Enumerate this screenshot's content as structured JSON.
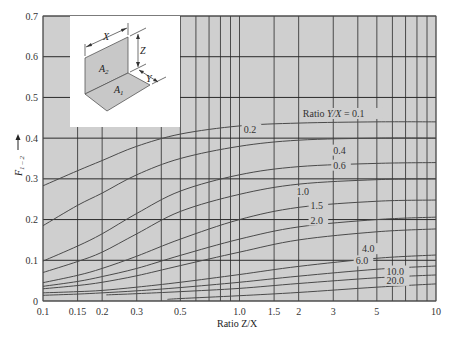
{
  "chart_data": {
    "type": "line",
    "title": "",
    "xlabel": "Ratio Z/X",
    "ylabel": "F1-2",
    "xscale": "log",
    "xlim": [
      0.1,
      10
    ],
    "ylim": [
      0,
      0.7
    ],
    "grid": true,
    "x_ticks": [
      0.1,
      0.15,
      0.2,
      0.3,
      0.5,
      1.0,
      1.5,
      2,
      3,
      5,
      10
    ],
    "x_tick_labels": [
      "0.1",
      "0.15",
      "0.2",
      "0.3",
      "0.5",
      "1.0",
      "1.5",
      "2",
      "3",
      "5",
      "10"
    ],
    "y_ticks": [
      0,
      0.1,
      0.2,
      0.3,
      0.4,
      0.5,
      0.6,
      0.7
    ],
    "y_tick_labels": [
      "0",
      "0.1",
      "0.2",
      "0.3",
      "0.4",
      "0.5",
      "0.6",
      "0.7"
    ],
    "x_grid": [
      0.1,
      0.15,
      0.2,
      0.3,
      0.4,
      0.5,
      0.6,
      0.7,
      0.8,
      0.9,
      1.0,
      1.5,
      2,
      3,
      4,
      5,
      6,
      7,
      8,
      9,
      10
    ],
    "legend_title": "Ratio Y/X",
    "series": [
      {
        "name": "0.1",
        "label": "Ratio Y/X = 0.1",
        "x": [
          0.1,
          0.15,
          0.2,
          0.3,
          0.5,
          1,
          2,
          5,
          10
        ],
        "values": [
          0.283,
          0.32,
          0.345,
          0.38,
          0.41,
          0.43,
          0.437,
          0.44,
          0.44
        ]
      },
      {
        "name": "0.2",
        "label": "0.2",
        "x": [
          0.1,
          0.15,
          0.2,
          0.3,
          0.5,
          1,
          2,
          5,
          10
        ],
        "values": [
          0.185,
          0.235,
          0.265,
          0.31,
          0.35,
          0.38,
          0.395,
          0.4,
          0.4
        ]
      },
      {
        "name": "0.4",
        "label": "0.4",
        "x": [
          0.1,
          0.15,
          0.2,
          0.3,
          0.5,
          1,
          2,
          5,
          10
        ],
        "values": [
          0.098,
          0.135,
          0.165,
          0.215,
          0.27,
          0.31,
          0.33,
          0.338,
          0.34
        ]
      },
      {
        "name": "0.6",
        "label": "0.6",
        "x": [
          0.1,
          0.15,
          0.2,
          0.3,
          0.5,
          1,
          2,
          5,
          10
        ],
        "values": [
          0.07,
          0.097,
          0.12,
          0.165,
          0.22,
          0.262,
          0.287,
          0.298,
          0.3
        ]
      },
      {
        "name": "1.0",
        "label": "1.0",
        "x": [
          0.1,
          0.15,
          0.2,
          0.3,
          0.5,
          1,
          2,
          5,
          10
        ],
        "values": [
          0.045,
          0.063,
          0.08,
          0.11,
          0.152,
          0.2,
          0.23,
          0.245,
          0.248
        ]
      },
      {
        "name": "1.5",
        "label": "1.5",
        "x": [
          0.1,
          0.15,
          0.2,
          0.3,
          0.5,
          1,
          2,
          5,
          10
        ],
        "values": [
          0.036,
          0.048,
          0.06,
          0.08,
          0.112,
          0.152,
          0.182,
          0.2,
          0.206
        ]
      },
      {
        "name": "2.0",
        "label": "2.0",
        "x": [
          0.1,
          0.15,
          0.2,
          0.3,
          0.5,
          1,
          2,
          5,
          10
        ],
        "values": [
          0.03,
          0.038,
          0.046,
          0.062,
          0.087,
          0.12,
          0.15,
          0.17,
          0.177
        ]
      },
      {
        "name": "4.0",
        "label": "4.0",
        "x": [
          0.1,
          0.15,
          0.2,
          0.3,
          0.5,
          1,
          2,
          5,
          10
        ],
        "values": [
          0.02,
          0.023,
          0.026,
          0.034,
          0.046,
          0.065,
          0.085,
          0.105,
          0.113
        ]
      },
      {
        "name": "6.0",
        "label": "6.0",
        "x": [
          0.1,
          0.15,
          0.2,
          0.3,
          0.5,
          1,
          2,
          5,
          10
        ],
        "values": [
          0.014,
          0.017,
          0.02,
          0.025,
          0.033,
          0.046,
          0.061,
          0.078,
          0.086
        ]
      },
      {
        "name": "10.0",
        "label": "10.0",
        "x": [
          0.21,
          0.3,
          0.5,
          1,
          2,
          5,
          10
        ],
        "values": [
          0.015,
          0.018,
          0.023,
          0.031,
          0.043,
          0.057,
          0.064
        ]
      },
      {
        "name": "20.0",
        "label": "20.0",
        "x": [
          0.43,
          0.5,
          1,
          2,
          5,
          10
        ],
        "values": [
          0.004,
          0.006,
          0.013,
          0.021,
          0.034,
          0.042
        ]
      }
    ],
    "annotations": [
      {
        "text": "Ratio Y/X = 0.1",
        "x": 2.1,
        "y": 0.452
      },
      {
        "text": "0.2",
        "x": 1.05,
        "y": 0.413
      },
      {
        "text": "0.4",
        "x": 3.0,
        "y": 0.362
      },
      {
        "text": "0.6",
        "x": 3.0,
        "y": 0.325
      },
      {
        "text": "1.0",
        "x": 1.95,
        "y": 0.26
      },
      {
        "text": "1.5",
        "x": 2.3,
        "y": 0.225
      },
      {
        "text": "2.0",
        "x": 2.3,
        "y": 0.19
      },
      {
        "text": "4.0",
        "x": 4.2,
        "y": 0.12
      },
      {
        "text": "6.0",
        "x": 3.9,
        "y": 0.09
      },
      {
        "text": "10.0",
        "x": 5.6,
        "y": 0.065
      },
      {
        "text": "20.0",
        "x": 5.6,
        "y": 0.042
      }
    ],
    "inset": {
      "labels": [
        "X",
        "Z",
        "Y",
        "A2",
        "A1"
      ],
      "description": "Two perpendicular rectangles A1 (horizontal) and A2 (vertical) sharing a common edge of length X; Z is height of A2, Y is width of A1"
    }
  },
  "axes": {
    "x_title": "Ratio Z/X",
    "y_title_main": "F",
    "y_title_sub": "1 – 2",
    "y_arrow": "↑"
  },
  "inset": {
    "x_label": "X",
    "z_label": "Z",
    "y_label": "Y",
    "a2_main": "A",
    "a2_sub": "2",
    "a1_main": "A",
    "a1_sub": "1"
  }
}
